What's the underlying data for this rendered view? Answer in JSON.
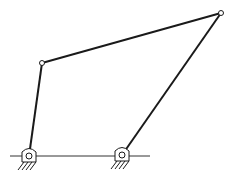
{
  "diagram": {
    "type": "four-bar-linkage",
    "colors": {
      "link": "#1a1a1a",
      "ground": "#333333",
      "joint_fill": "#ffffff"
    },
    "ground_line": {
      "x1": 10,
      "y1": 156,
      "x2": 150,
      "y2": 156
    },
    "fixed_pivots": [
      {
        "name": "left-ground-pivot",
        "x": 29,
        "y": 156
      },
      {
        "name": "right-ground-pivot",
        "x": 122,
        "y": 155
      }
    ],
    "moving_joints": [
      {
        "name": "top-left-joint",
        "x": 42,
        "y": 63
      },
      {
        "name": "top-right-joint",
        "x": 221,
        "y": 13
      }
    ],
    "links": [
      {
        "name": "input-crank",
        "from": "left-ground-pivot",
        "to": "top-left-joint"
      },
      {
        "name": "coupler-link",
        "from": "top-left-joint",
        "to": "top-right-joint"
      },
      {
        "name": "output-rocker",
        "from": "top-right-joint",
        "to": "right-ground-pivot"
      }
    ]
  }
}
